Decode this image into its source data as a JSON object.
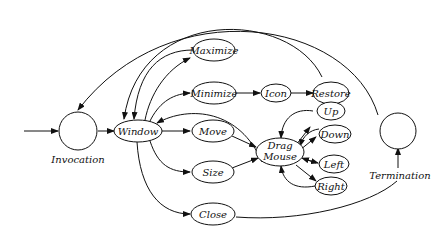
{
  "diagram": {
    "type": "state-transition",
    "states": {
      "invocation": {
        "label": "Invocation"
      },
      "termination": {
        "label": "Termination"
      },
      "window": {
        "label": "Window"
      },
      "maximize": {
        "label": "Maximize"
      },
      "minimize": {
        "label": "Minimize"
      },
      "icon": {
        "label": "Icon"
      },
      "restore": {
        "label": "Restore"
      },
      "move": {
        "label": "Move"
      },
      "size": {
        "label": "Size"
      },
      "close": {
        "label": "Close"
      },
      "drag_mouse": {
        "label_line1": "Drag",
        "label_line2": "Mouse"
      },
      "up": {
        "label": "Up"
      },
      "down": {
        "label": "Down"
      },
      "left": {
        "label": "Left"
      },
      "right": {
        "label": "Right"
      }
    },
    "edges": [
      {
        "from": "entry",
        "to": "invocation"
      },
      {
        "from": "invocation",
        "to": "window"
      },
      {
        "from": "window",
        "to": "maximize"
      },
      {
        "from": "maximize",
        "to": "window"
      },
      {
        "from": "window",
        "to": "minimize"
      },
      {
        "from": "minimize",
        "to": "icon"
      },
      {
        "from": "icon",
        "to": "restore"
      },
      {
        "from": "restore",
        "to": "window"
      },
      {
        "from": "window",
        "to": "move"
      },
      {
        "from": "window",
        "to": "size"
      },
      {
        "from": "window",
        "to": "close"
      },
      {
        "from": "move",
        "to": "drag_mouse"
      },
      {
        "from": "size",
        "to": "drag_mouse"
      },
      {
        "from": "drag_mouse",
        "to": "window"
      },
      {
        "from": "drag_mouse",
        "to": "up"
      },
      {
        "from": "up",
        "to": "drag_mouse"
      },
      {
        "from": "drag_mouse",
        "to": "down"
      },
      {
        "from": "down",
        "to": "drag_mouse"
      },
      {
        "from": "drag_mouse",
        "to": "left"
      },
      {
        "from": "left",
        "to": "drag_mouse"
      },
      {
        "from": "drag_mouse",
        "to": "right"
      },
      {
        "from": "right",
        "to": "drag_mouse"
      },
      {
        "from": "close",
        "to": "termination"
      },
      {
        "from": "termination",
        "to": "invocation"
      }
    ]
  }
}
